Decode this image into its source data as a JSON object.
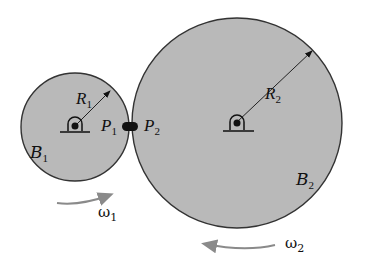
{
  "diagram": {
    "type": "two contacting rotating discs",
    "colors": {
      "disc_fill": "#b9b9b9",
      "outline": "#333333",
      "arrow": "#8a8a8a"
    },
    "bodies": [
      {
        "name": "B",
        "sub": "1",
        "radius_label": "R",
        "radius_sub": "1",
        "omega": "ω",
        "omega_sub": "1"
      },
      {
        "name": "B",
        "sub": "2",
        "radius_label": "R",
        "radius_sub": "2",
        "omega": "ω",
        "omega_sub": "2"
      }
    ],
    "contact_points": [
      {
        "label": "P",
        "sub": "1"
      },
      {
        "label": "P",
        "sub": "2"
      }
    ]
  }
}
